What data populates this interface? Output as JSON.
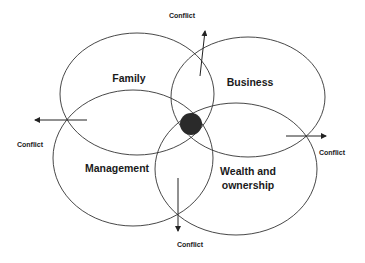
{
  "diagram": {
    "type": "four-circle venn (family business system)",
    "circles": [
      {
        "label": "Family",
        "cx": 137,
        "cy": 94,
        "rx": 77,
        "ry": 61,
        "label_x": 129,
        "label_y": 82
      },
      {
        "label": "Business",
        "cx": 248,
        "cy": 97,
        "rx": 77,
        "ry": 60,
        "label_x": 250,
        "label_y": 86
      },
      {
        "label": "Management",
        "cx": 133,
        "cy": 158,
        "rx": 80,
        "ry": 68,
        "label_x": 117,
        "label_y": 172
      },
      {
        "label_line1": "Wealth  and",
        "label_line2": "ownership",
        "cx": 236,
        "cy": 169,
        "rx": 81,
        "ry": 66,
        "label_x": 248,
        "label_y1": 175,
        "label_y2": 189
      }
    ],
    "center_dot": {
      "cx": 191,
      "cy": 124,
      "r": 11,
      "color": "#2a2a2a"
    },
    "conflicts": [
      {
        "label": "Conflict",
        "x1": 200,
        "y1": 76,
        "x2": 205,
        "y2": 31,
        "label_x": 182,
        "label_y": 18
      },
      {
        "label": "Conflict",
        "x1": 87,
        "y1": 120,
        "x2": 35,
        "y2": 120,
        "label_x": 30,
        "label_y": 147
      },
      {
        "label": "Conflict",
        "x1": 286,
        "y1": 136,
        "x2": 326,
        "y2": 136,
        "label_x": 332,
        "label_y": 155
      },
      {
        "label": "Conflict",
        "x1": 178,
        "y1": 178,
        "x2": 178,
        "y2": 231,
        "label_x": 190,
        "label_y": 247
      }
    ],
    "stroke_color": "#333333"
  }
}
